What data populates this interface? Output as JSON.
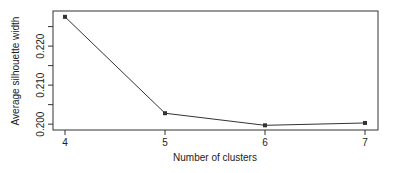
{
  "chart_data": {
    "type": "line",
    "title": "",
    "xlabel": "Number of clusters",
    "ylabel": "Average silhouette width",
    "x": [
      4,
      5,
      6,
      7
    ],
    "values": [
      0.2275,
      0.2028,
      0.1997,
      0.2003
    ],
    "series": [
      {
        "name": "Average silhouette width",
        "x": [
          4,
          5,
          6,
          7
        ],
        "values": [
          0.2275,
          0.2028,
          0.1997,
          0.2003
        ],
        "marker": "square",
        "color": "#333333"
      }
    ],
    "xticks": [
      4,
      5,
      6,
      7
    ],
    "xtick_labels": [
      "4",
      "5",
      "6",
      "7"
    ],
    "yticks": [
      0.2,
      0.205,
      0.21,
      0.215,
      0.22,
      0.225
    ],
    "ytick_labels": [
      "0.200",
      "",
      "0.210",
      "",
      "0.220",
      ""
    ],
    "xlim": [
      3.88,
      7.13
    ],
    "ylim": [
      0.1985,
      0.229
    ],
    "grid": false,
    "legend": null
  },
  "labels": {
    "xlabel": "Number of clusters",
    "ylabel": "Average silhouette width"
  }
}
